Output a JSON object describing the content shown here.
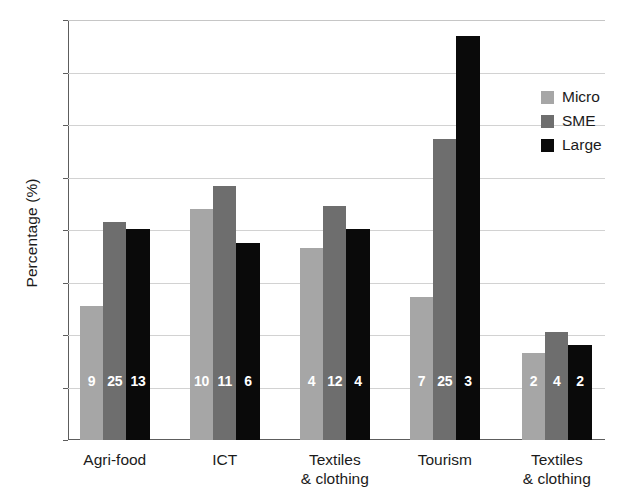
{
  "chart_data": {
    "type": "bar",
    "title": "",
    "subtitle": "",
    "xlabel": "",
    "ylabel": "Percentage (%)",
    "ylim": [
      0,
      80
    ],
    "ytick_step": 10,
    "yticks": [
      "0",
      "10",
      "20",
      "30",
      "40",
      "50",
      "60",
      "70",
      "80"
    ],
    "grid": true,
    "legend_position": "upper-right",
    "categories": [
      "Agri-food",
      "ICT",
      "Textiles\n& clothing",
      "Tourism",
      "Textiles\n& clothing"
    ],
    "series": [
      {
        "name": "Micro",
        "color": "#a6a6a6",
        "values": [
          25.5,
          44.0,
          36.5,
          27.2,
          16.5
        ],
        "point_labels": [
          "9",
          "10",
          "4",
          "7",
          "2"
        ]
      },
      {
        "name": "SME",
        "color": "#6e6e6e",
        "values": [
          41.5,
          48.4,
          44.5,
          57.3,
          20.6
        ],
        "point_labels": [
          "25",
          "11",
          "12",
          "25",
          "4"
        ]
      },
      {
        "name": "Large",
        "color": "#0a0a0a",
        "values": [
          40.2,
          37.5,
          40.1,
          76.9,
          18.1
        ],
        "point_labels": [
          "13",
          "6",
          "4",
          "3",
          "2"
        ]
      }
    ],
    "point_label_color": "#ffffff",
    "axis_color": "#5d5d5d",
    "grid_color": "#d2d2d2",
    "background": "#ffffff"
  },
  "legend": {
    "items": [
      {
        "label": "Micro",
        "color": "#a6a6a6"
      },
      {
        "label": "SME",
        "color": "#6e6e6e"
      },
      {
        "label": "Large",
        "color": "#0a0a0a"
      }
    ]
  }
}
